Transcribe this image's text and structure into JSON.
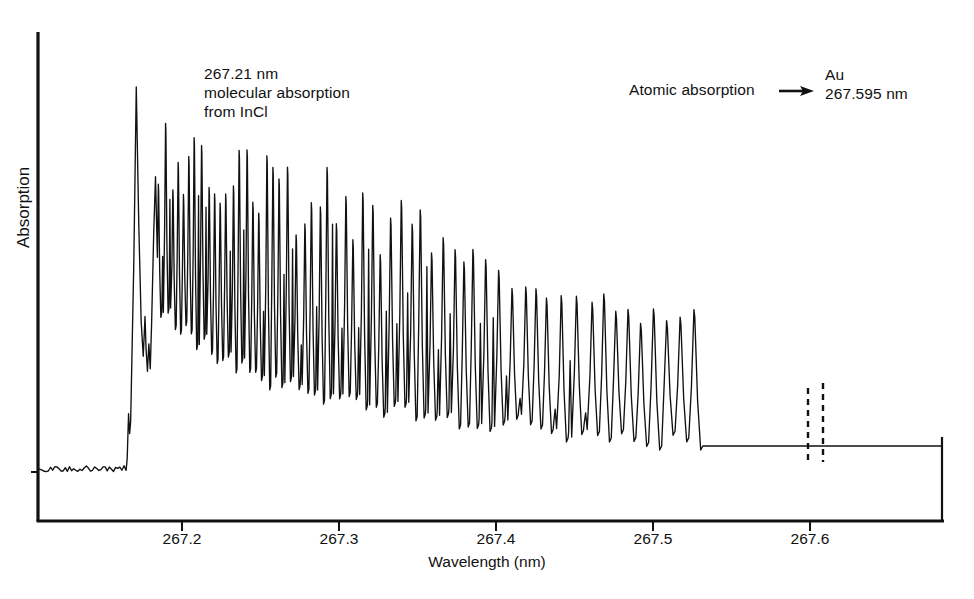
{
  "figure": {
    "background": "#ffffff",
    "line_color": "#111111",
    "axis_color": "#111111"
  },
  "annotations": {
    "incl_label": "267.21 nm\nmolecular absorption\nfrom InCl",
    "atomic_label": "Atomic absorption",
    "au_label": "Au\n267.595 nm",
    "arrow_icon": "right-arrow"
  },
  "chart_data": {
    "type": "line",
    "title": "",
    "subtitle": "",
    "xlabel": "Wavelength (nm)",
    "ylabel": "Absorption",
    "xlim": [
      267.155,
      267.672
    ],
    "ylim": [
      0,
      1
    ],
    "grid": false,
    "legend": null,
    "xticks": [
      267.2,
      267.3,
      267.4,
      267.5,
      267.6
    ],
    "xticklabels": [
      "267.2",
      "267.3",
      "267.4",
      "267.5",
      "267.6"
    ],
    "yticks": [],
    "yticklabels": [],
    "baseline_absorption": 0.105,
    "features": [
      {
        "name": "InCl band head",
        "wavelength_nm": 267.21,
        "type": "molecular band head",
        "peak_absorption": 0.87
      },
      {
        "name": "Au atomic line",
        "wavelength_nm": 267.595,
        "type": "atomic absorption line",
        "peak_absorption": 1.0
      }
    ],
    "envelope": {
      "description": "InCl molecular rotational structure decaying from band head toward longer wavelength",
      "x": [
        267.215,
        267.23,
        267.25,
        267.27,
        267.3,
        267.33,
        267.36,
        267.39,
        267.42,
        267.45,
        267.48,
        267.51,
        267.54,
        267.57,
        267.6,
        267.63,
        267.665
      ],
      "upper": [
        0.74,
        0.73,
        0.71,
        0.695,
        0.655,
        0.615,
        0.575,
        0.535,
        0.495,
        0.46,
        0.425,
        0.4,
        0.4,
        0.405,
        0.375,
        0.33,
        0.3
      ],
      "lower": [
        0.45,
        0.4,
        0.34,
        0.3,
        0.26,
        0.235,
        0.215,
        0.2,
        0.19,
        0.175,
        0.165,
        0.155,
        0.145,
        0.14,
        0.135,
        0.13,
        0.13
      ]
    },
    "rotational_lines": {
      "description": "Quasi-periodic rotational line oscillation; spacing increases with wavelength",
      "start_nm": 267.215,
      "end_nm": 267.665,
      "approx_line_count": 58
    },
    "dashed_markers": {
      "description": "Dashed vertical guides flanking the Au atomic line base",
      "wavelengths_nm": [
        267.589,
        267.6
      ]
    }
  }
}
